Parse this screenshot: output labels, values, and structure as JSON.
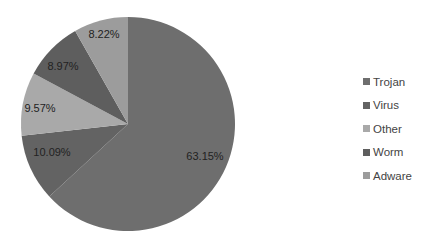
{
  "chart_data": {
    "type": "pie",
    "title": "",
    "categories": [
      "Trojan",
      "Virus",
      "Other",
      "Worm",
      "Adware"
    ],
    "values": [
      63.15,
      10.09,
      9.57,
      8.97,
      8.22
    ],
    "labels": [
      "63.15%",
      "10.09%",
      "9.57%",
      "8.97%",
      "8.22%"
    ],
    "colors": [
      "#6e6e6e",
      "#636363",
      "#a9a9a9",
      "#5e5e5e",
      "#9c9c9c"
    ],
    "legend_position": "right"
  },
  "legend": {
    "items": [
      {
        "label": "Trojan",
        "color": "#6e6e6e"
      },
      {
        "label": "Virus",
        "color": "#636363"
      },
      {
        "label": "Other",
        "color": "#a9a9a9"
      },
      {
        "label": "Worm",
        "color": "#5e5e5e"
      },
      {
        "label": "Adware",
        "color": "#9c9c9c"
      }
    ]
  }
}
